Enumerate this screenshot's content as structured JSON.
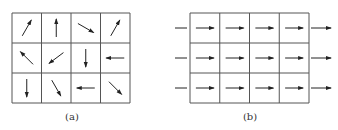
{
  "figure": {
    "panels": [
      {
        "id": "a",
        "label": "(a)",
        "rows": 3,
        "cols": 4,
        "arrows": [
          [
            "northeast",
            "north",
            "southeast-shallow",
            "northeast"
          ],
          [
            "northwest",
            "southwest",
            "south",
            "west"
          ],
          [
            "south",
            "southeast-steep",
            "west",
            "southeast"
          ]
        ],
        "description": "randomly oriented arrows"
      },
      {
        "id": "b",
        "label": "(b)",
        "rows": 3,
        "cols": 4,
        "arrows": [
          [
            "east",
            "east",
            "east",
            "east"
          ],
          [
            "east",
            "east",
            "east",
            "east"
          ],
          [
            "east",
            "east",
            "east",
            "east"
          ]
        ],
        "external_lines": "incoming line left and outgoing arrow right on each row",
        "description": "uniformly aligned arrows"
      }
    ],
    "colors": {
      "line": "#555555",
      "arrow": "#222222",
      "background": "#ffffff"
    }
  }
}
